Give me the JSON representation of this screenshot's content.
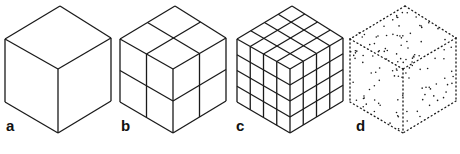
{
  "figure": {
    "panels": [
      {
        "label": "a",
        "subdivisions": 1,
        "style": "solid"
      },
      {
        "label": "b",
        "subdivisions": 2,
        "style": "solid"
      },
      {
        "label": "c",
        "subdivisions": 4,
        "style": "solid"
      },
      {
        "label": "d",
        "subdivisions": 0,
        "style": "dotted"
      }
    ],
    "stroke_color": "#1a1a1a",
    "background": "#ffffff"
  }
}
